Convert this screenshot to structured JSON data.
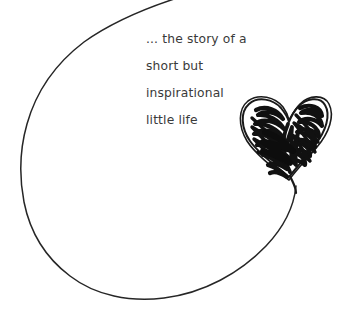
{
  "artwork": {
    "title": "hand-drawn balloon loop with scribbled heart",
    "background_color": "#ffffff",
    "stroke_color": "#262626",
    "ink_color": "#1a1a1a",
    "loop_name": "balloon-outline",
    "heart_name": "scribbled-heart"
  },
  "caption": {
    "lines": [
      "... the story of a",
      "short but",
      "inspirational",
      "little life"
    ],
    "text_color": "#3a3a3a"
  }
}
